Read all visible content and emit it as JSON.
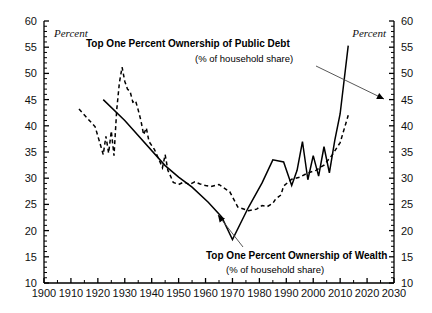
{
  "chart_data": {
    "type": "line",
    "title": "",
    "xlabel": "",
    "ylabel": "Percent",
    "ylabel_right": "Percent",
    "xlim": [
      1900,
      2030
    ],
    "ylim": [
      10,
      60
    ],
    "xticks": [
      1900,
      1910,
      1920,
      1930,
      1940,
      1950,
      1960,
      1970,
      1980,
      1990,
      2000,
      2010,
      2020,
      2030
    ],
    "yticks": [
      10,
      15,
      20,
      25,
      30,
      35,
      40,
      45,
      50,
      55,
      60
    ],
    "ytick_minor_step": 1,
    "xtick_minor_step": 5,
    "grid": false,
    "legend_position": "annotations-inline",
    "annotations": [
      {
        "id": "public-debt",
        "title": "Top One Percent Ownership of Public Debt",
        "subtitle": "(% of household share)",
        "points_to_series": "public_debt"
      },
      {
        "id": "wealth",
        "title": "Top One Percent Ownership of Wealth",
        "subtitle": "(% of household share)",
        "points_to_series": "wealth"
      }
    ],
    "series": [
      {
        "name": "Top One Percent Ownership of Public Debt",
        "key": "public_debt",
        "style": "solid",
        "color": "#000000",
        "x": [
          1922,
          1930,
          1945,
          1950,
          1955,
          1961,
          1966,
          1970,
          1976,
          1981,
          1985,
          1989,
          1992,
          1994,
          1996,
          1998,
          2000,
          2002,
          2004,
          2006,
          2008,
          2010,
          2013
        ],
        "y": [
          45,
          41,
          32.4,
          30.2,
          28.3,
          25.4,
          22.6,
          18.3,
          24.5,
          29.1,
          33.5,
          33.1,
          28.6,
          31.5,
          37.0,
          29.7,
          34.3,
          30.4,
          36.0,
          31.0,
          37.2,
          42.3,
          55.3
        ]
      },
      {
        "name": "Top One Percent Ownership of Wealth",
        "key": "wealth",
        "style": "dashed",
        "color": "#000000",
        "x": [
          1913,
          1916,
          1919,
          1921,
          1922,
          1923,
          1924,
          1925,
          1926,
          1927,
          1928,
          1929,
          1930,
          1931,
          1932,
          1933,
          1934,
          1935,
          1936,
          1937,
          1938,
          1939,
          1941,
          1943,
          1944,
          1945,
          1946,
          1947,
          1948,
          1949,
          1950,
          1952,
          1954,
          1956,
          1958,
          1960,
          1962,
          1965,
          1969,
          1972,
          1976,
          1979,
          1981,
          1983,
          1985,
          1986,
          1988,
          1989,
          1992,
          1995,
          1998,
          2001,
          2004,
          2007,
          2010,
          2013
        ],
        "y": [
          43.2,
          41.5,
          39.8,
          36.3,
          34.5,
          38.0,
          34.8,
          39.0,
          34.3,
          43.0,
          48.2,
          51.2,
          48.5,
          47.0,
          46.5,
          44.5,
          44.8,
          43.0,
          41.0,
          38.3,
          39.6,
          37.0,
          35.5,
          33.2,
          32.0,
          34.5,
          31.5,
          30.4,
          29.2,
          29.0,
          28.8,
          29.3,
          28.8,
          29.3,
          28.9,
          28.6,
          28.4,
          28.8,
          27.4,
          24.5,
          23.8,
          24.1,
          24.8,
          24.6,
          25.2,
          26.0,
          26.8,
          28.5,
          29.8,
          30.2,
          31.0,
          31.5,
          32.5,
          34.4,
          36.8,
          42.0
        ]
      }
    ]
  },
  "axes": {
    "left_unit_label": "Percent",
    "right_unit_label": "Percent"
  }
}
